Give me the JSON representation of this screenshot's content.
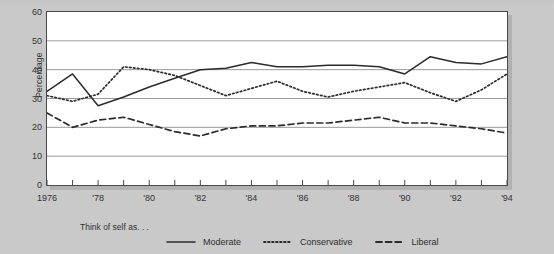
{
  "chart_data": {
    "type": "line",
    "title": "",
    "xlabel": "",
    "ylabel": "Percentage",
    "ylim": [
      0,
      60
    ],
    "ytick_values": [
      60,
      50,
      40,
      30,
      20,
      10,
      0
    ],
    "ytick_labels": [
      "60",
      "50",
      "40",
      "30",
      "20",
      "10",
      "0"
    ],
    "xlim": [
      1976,
      1994
    ],
    "grid": "horizontal",
    "legend_position": "bottom",
    "legend_caption": "Think of self as. . .",
    "x": [
      1976,
      1977,
      1978,
      1979,
      1980,
      1981,
      1982,
      1983,
      1984,
      1985,
      1986,
      1987,
      1988,
      1989,
      1990,
      1991,
      1992,
      1993,
      1994
    ],
    "xtick_labels": [
      "1976",
      "",
      "'78",
      "",
      "'80",
      "",
      "'82",
      "",
      "'84",
      "",
      "'86",
      "",
      "'88",
      "",
      "'90",
      "",
      "'92",
      "",
      "'94"
    ],
    "series": [
      {
        "name": "Moderate",
        "style": "solid",
        "color": "#2b2b2b",
        "values": [
          32.5,
          38.5,
          27.5,
          30.5,
          34.0,
          37.0,
          40.0,
          40.5,
          42.5,
          41.0,
          41.0,
          41.5,
          41.5,
          41.0,
          38.5,
          44.5,
          42.5,
          42.0,
          44.5
        ]
      },
      {
        "name": "Conservative",
        "style": "dotted",
        "color": "#2b2b2b",
        "values": [
          31.0,
          29.0,
          31.5,
          41.0,
          40.0,
          38.0,
          34.5,
          31.0,
          33.5,
          36.0,
          32.5,
          30.5,
          32.5,
          34.0,
          35.5,
          32.0,
          29.0,
          33.0,
          38.5
        ]
      },
      {
        "name": "Liberal",
        "style": "dashed",
        "color": "#2b2b2b",
        "values": [
          25.0,
          20.0,
          22.5,
          23.5,
          21.0,
          18.5,
          17.0,
          19.5,
          20.5,
          20.5,
          21.5,
          21.5,
          22.5,
          23.5,
          21.5,
          21.5,
          20.5,
          19.5,
          18.0
        ]
      }
    ]
  }
}
